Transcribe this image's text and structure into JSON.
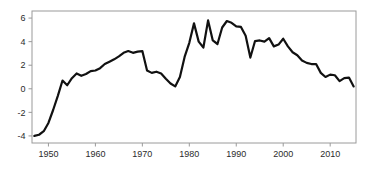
{
  "chart_data": {
    "type": "line",
    "title": "",
    "subtitle": "",
    "xlabel": "",
    "ylabel": "",
    "xlim": [
      1946.5,
      2015.5
    ],
    "ylim": [
      -4.6,
      6.6
    ],
    "xticks": [
      1950,
      1960,
      1970,
      1980,
      1990,
      2000,
      2010
    ],
    "xtick_labels": [
      "1950",
      "1960",
      "1970",
      "1980",
      "1990",
      "2000",
      "2010"
    ],
    "yticks": [
      -4,
      -2,
      0,
      2,
      4,
      6
    ],
    "ytick_labels": [
      "-4",
      "-2",
      "0",
      "2",
      "4",
      "6"
    ],
    "grid": false,
    "legend": null,
    "legend_position": "none",
    "line_color": "#111111",
    "line_width": 2.2,
    "frame_color": "#9a9a9a",
    "background": "#ffffff",
    "series": [
      {
        "name": "series-1",
        "x": [
          1947,
          1948,
          1949,
          1950,
          1951,
          1952,
          1953,
          1954,
          1955,
          1956,
          1957,
          1958,
          1959,
          1960,
          1961,
          1962,
          1963,
          1964,
          1965,
          1966,
          1967,
          1968,
          1969,
          1970,
          1971,
          1972,
          1973,
          1974,
          1975,
          1976,
          1977,
          1978,
          1979,
          1980,
          1981,
          1982,
          1983,
          1984,
          1985,
          1986,
          1987,
          1988,
          1989,
          1990,
          1991,
          1992,
          1993,
          1994,
          1995,
          1996,
          1997,
          1998,
          1999,
          2000,
          2001,
          2002,
          2003,
          2004,
          2005,
          2006,
          2007,
          2008,
          2009,
          2010,
          2011,
          2012,
          2013,
          2014,
          2015
        ],
        "y": [
          -4.0,
          -3.9,
          -3.6,
          -2.9,
          -1.8,
          -0.6,
          0.7,
          0.3,
          0.9,
          1.3,
          1.1,
          1.25,
          1.5,
          1.55,
          1.75,
          2.1,
          2.3,
          2.5,
          2.75,
          3.05,
          3.2,
          3.05,
          3.15,
          3.2,
          1.55,
          1.35,
          1.45,
          1.3,
          0.85,
          0.45,
          0.2,
          1.0,
          2.7,
          3.9,
          5.55,
          4.0,
          3.5,
          5.8,
          4.1,
          3.8,
          5.2,
          5.75,
          5.6,
          5.3,
          5.25,
          4.5,
          2.65,
          4.05,
          4.1,
          4.0,
          4.3,
          3.6,
          3.75,
          4.25,
          3.6,
          3.1,
          2.85,
          2.4,
          2.2,
          2.1,
          2.1,
          1.35,
          1.0,
          1.2,
          1.15,
          0.65,
          0.9,
          0.95,
          0.2
        ]
      }
    ]
  }
}
